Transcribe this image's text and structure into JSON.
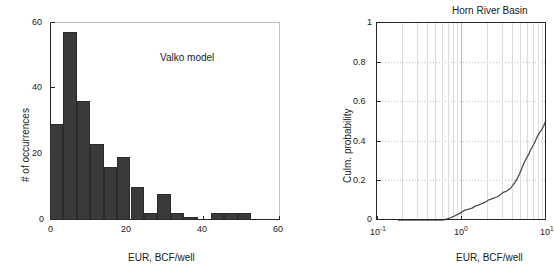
{
  "figure": {
    "width": 546,
    "height": 280,
    "background": "#ffffff",
    "axis_color": "#262626",
    "bar_color": "#3a3a3a",
    "grid_color": "#c8c8c8",
    "curve_color": "#4d4d4d"
  },
  "left_panel": {
    "annotation": "Valko model",
    "xlabel": "EUR, BCF/well",
    "ylabel": "# of occurrences",
    "xticklabels": [
      "0",
      "20",
      "40",
      "60"
    ],
    "yticklabels": [
      "0",
      "20",
      "40",
      "60"
    ]
  },
  "right_panel": {
    "title": "Horn River Basin",
    "xlabel": "EUR, BCF/well",
    "ylabel": "Culm. probability",
    "xticklabels": [
      "10",
      "10",
      "10"
    ],
    "xtickexponents": [
      "-1",
      "0",
      "1"
    ],
    "yticklabels": [
      "0",
      "0.2",
      "0.4",
      "0.6",
      "0.8",
      "1"
    ]
  },
  "chart_data": [
    {
      "type": "bar",
      "title": "",
      "annotation": "Valko model",
      "xlabel": "EUR, BCF/well",
      "ylabel": "# of occurrences",
      "xlim": [
        0,
        60
      ],
      "ylim": [
        0,
        60
      ],
      "xticks": [
        0,
        20,
        40,
        60
      ],
      "yticks": [
        0,
        20,
        40,
        60
      ],
      "grid": false,
      "bin_width": 3.5,
      "bin_edges": [
        0,
        3.5,
        7,
        10.5,
        14,
        17.5,
        21,
        24.5,
        28,
        31.5,
        35,
        38.5,
        42,
        45.5,
        49,
        52.5
      ],
      "bin_centers": [
        1.75,
        5.25,
        8.75,
        12.25,
        15.75,
        19.25,
        22.75,
        26.25,
        29.75,
        33.25,
        36.75,
        40.25,
        43.75,
        47.25,
        50.75
      ],
      "values": [
        29,
        57,
        36,
        23,
        16,
        19,
        10,
        2,
        8,
        2,
        1,
        0,
        2,
        2,
        2
      ]
    },
    {
      "type": "line",
      "title": "Horn River Basin",
      "xlabel": "EUR, BCF/well",
      "ylabel": "Culm. probability",
      "xscale": "log",
      "xlim": [
        0.1,
        20
      ],
      "ylim": [
        0,
        1
      ],
      "xticks": [
        0.1,
        1,
        10
      ],
      "yticks": [
        0,
        0.2,
        0.4,
        0.6,
        0.8,
        1
      ],
      "grid": true,
      "x": [
        0.2,
        0.3,
        0.4,
        0.5,
        0.6,
        0.7,
        0.8,
        0.9,
        1.0,
        1.15,
        1.3,
        1.45,
        1.6,
        1.8,
        2.0,
        2.2,
        2.4,
        2.6,
        2.8,
        3.0,
        3.3,
        3.6,
        3.9,
        4.2,
        4.5,
        4.9,
        5.3,
        5.7,
        6.1,
        6.6,
        7.1,
        7.6,
        8.2,
        8.8,
        9.4,
        10.0,
        10.8,
        11.6,
        12.4,
        13.3,
        14.2,
        15.2,
        16.3,
        17.4,
        18.6,
        19.8
      ],
      "y": [
        0.0,
        0.0,
        0.0,
        0.0,
        0.0,
        0.0,
        0.0,
        0.005,
        0.01,
        0.02,
        0.03,
        0.04,
        0.05,
        0.055,
        0.06,
        0.07,
        0.075,
        0.08,
        0.085,
        0.09,
        0.1,
        0.105,
        0.11,
        0.115,
        0.12,
        0.13,
        0.14,
        0.145,
        0.15,
        0.16,
        0.175,
        0.19,
        0.21,
        0.235,
        0.26,
        0.285,
        0.31,
        0.33,
        0.355,
        0.375,
        0.395,
        0.42,
        0.44,
        0.455,
        0.475,
        0.5
      ]
    }
  ]
}
